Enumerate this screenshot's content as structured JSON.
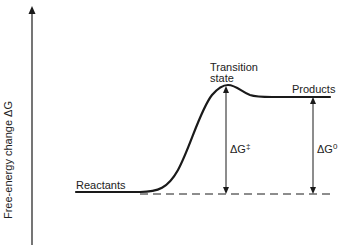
{
  "diagram": {
    "type": "reaction-energy-profile",
    "y_axis": {
      "label": "Free-energy change  ΔG",
      "direction": "up"
    },
    "labels": {
      "reactants": "Reactants",
      "transition_state_line1": "Transition",
      "transition_state_line2": "state",
      "products": "Products"
    },
    "arrows": {
      "activation": {
        "symbol": "ΔG",
        "superscript": "‡"
      },
      "standard": {
        "symbol": "ΔG",
        "superscript": "0"
      }
    },
    "colors": {
      "line": "#1a1a1a",
      "background": "#ffffff"
    }
  }
}
